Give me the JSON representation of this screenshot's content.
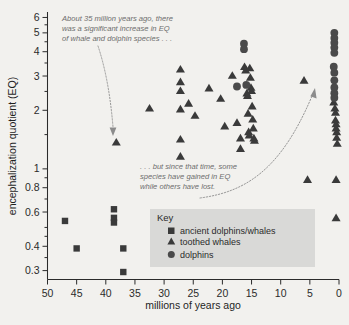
{
  "figure": {
    "background_color": "#f2f1ee",
    "plot_background_color": "#f2f1ee"
  },
  "axes": {
    "y_title": "encephalization quotient (EQ)",
    "x_title": "millions of years ago",
    "y_ticks": [
      "6",
      "5",
      "4",
      "3",
      "2",
      "1",
      "0.8",
      "0.6",
      "0.4",
      "0.3"
    ],
    "x_ticks": [
      "50",
      "45",
      "40",
      "35",
      "30",
      "25",
      "20",
      "15",
      "10",
      "5",
      "0"
    ]
  },
  "legend": {
    "title": "Key",
    "items": [
      {
        "marker": "square-marker",
        "label": "ancient dolphins/whales"
      },
      {
        "marker": "triangle-marker",
        "label": "toothed whales"
      },
      {
        "marker": "circle-marker",
        "label": "dolphins"
      }
    ]
  },
  "annotations": [
    {
      "id": "annotation-increase",
      "lines": [
        "About 35 million years ago, there",
        "was a significant increase in EQ",
        "of whale and dolphin species . . ."
      ]
    },
    {
      "id": "annotation-divergence",
      "lines": [
        ". . . but since that time, some",
        "species have gained in EQ",
        "while others have lost."
      ]
    }
  ],
  "chart_data": {
    "type": "scatter",
    "title": "",
    "xlabel": "millions of years ago",
    "ylabel": "encephalization quotient (EQ)",
    "x_scale": "linear",
    "x_reversed": true,
    "xlim": [
      50,
      0
    ],
    "y_scale": "log",
    "ylim": [
      0.27,
      6.4
    ],
    "grid": false,
    "legend_position": "inside-lower-right",
    "series": [
      {
        "name": "ancient dolphins/whales",
        "marker": "square",
        "color": "#3a3a3a",
        "points": [
          [
            47.0,
            0.54
          ],
          [
            45.0,
            0.39
          ],
          [
            38.6,
            0.62
          ],
          [
            38.6,
            0.56
          ],
          [
            38.6,
            0.53
          ],
          [
            37.0,
            0.39
          ],
          [
            37.0,
            0.295
          ]
        ]
      },
      {
        "name": "toothed whales",
        "marker": "triangle",
        "color": "#3a3a3a",
        "points": [
          [
            38.2,
            1.37
          ],
          [
            32.5,
            2.05
          ],
          [
            27.2,
            3.25
          ],
          [
            27.2,
            2.8
          ],
          [
            27.2,
            2.52
          ],
          [
            27.2,
            2.03
          ],
          [
            27.2,
            1.42
          ],
          [
            27.2,
            1.16
          ],
          [
            25.8,
            2.17
          ],
          [
            24.7,
            1.88
          ],
          [
            22.3,
            2.6
          ],
          [
            20.3,
            2.3
          ],
          [
            19.6,
            1.66
          ],
          [
            18.3,
            3.02
          ],
          [
            17.5,
            1.73
          ],
          [
            16.9,
            1.44
          ],
          [
            16.9,
            1.27
          ],
          [
            16.2,
            3.35
          ],
          [
            16.0,
            3.22
          ],
          [
            15.8,
            2.45
          ],
          [
            15.7,
            2.38
          ],
          [
            15.6,
            1.93
          ],
          [
            15.5,
            1.55
          ],
          [
            15.4,
            1.49
          ],
          [
            15.3,
            3.3
          ],
          [
            15.2,
            2.95
          ],
          [
            15.1,
            2.62
          ],
          [
            15.0,
            2.52
          ],
          [
            14.9,
            2.1
          ],
          [
            14.8,
            1.8
          ],
          [
            14.7,
            1.62
          ],
          [
            14.6,
            1.44
          ],
          [
            14.5,
            1.4
          ],
          [
            6.0,
            2.85
          ],
          [
            5.4,
            0.88
          ],
          [
            0.9,
            2.2
          ],
          [
            0.7,
            2.05
          ],
          [
            0.6,
            1.95
          ],
          [
            0.6,
            1.78
          ],
          [
            0.5,
            1.7
          ],
          [
            0.5,
            1.62
          ],
          [
            0.4,
            1.55
          ],
          [
            0.4,
            1.45
          ],
          [
            0.3,
            1.35
          ],
          [
            0.5,
            0.88
          ],
          [
            0.5,
            0.56
          ]
        ]
      },
      {
        "name": "dolphins",
        "marker": "circle",
        "color": "#4a4a4a",
        "points": [
          [
            16.3,
            4.4
          ],
          [
            16.3,
            4.12
          ],
          [
            17.5,
            2.65
          ],
          [
            15.9,
            2.7
          ],
          [
            0.8,
            5.0
          ],
          [
            0.8,
            4.7
          ],
          [
            0.8,
            4.45
          ],
          [
            0.8,
            4.2
          ],
          [
            0.8,
            3.95
          ],
          [
            0.9,
            3.35
          ],
          [
            0.8,
            3.12
          ],
          [
            0.8,
            2.85
          ],
          [
            0.8,
            2.62
          ],
          [
            0.8,
            2.45
          ],
          [
            0.8,
            2.32
          ]
        ]
      }
    ]
  }
}
